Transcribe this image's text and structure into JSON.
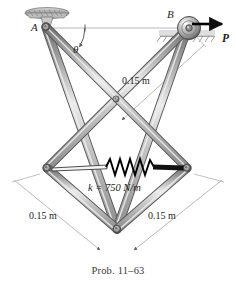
{
  "figure": {
    "type": "engineering-mechanics-diagram",
    "caption": "Prob. 11–63",
    "labels": {
      "point_a": "A",
      "point_b": "B",
      "angle_theta": "θ",
      "force_p": "P",
      "spring_constant": "k = 750 N/m",
      "dim_upper_right": "0.15 m",
      "dim_lower_left": "0.15 m",
      "dim_lower_right": "0.15 m"
    },
    "values": {
      "spring_stiffness_value": "750",
      "spring_stiffness_units": "N/m",
      "member_length_value": "0.15",
      "member_length_units": "m",
      "problem_number": "11–63"
    },
    "colors": {
      "bar_fill": "#b8b8b8",
      "bar_highlight": "#e6e6e6",
      "bar_stroke": "#4d4d4d",
      "pin_fill": "#8c8c8c",
      "text": "#231f20",
      "caption": "#3a3a3a",
      "dimension_line": "#9a9a9a",
      "force_arrow": "#000000",
      "spring": "#000000",
      "support_hatch": "#8a8a8a"
    },
    "geometry": {
      "point_a": [
        46,
        27
      ],
      "point_b": [
        187,
        27
      ],
      "center_pin": [
        116,
        99
      ],
      "left_pin": [
        47,
        168
      ],
      "right_pin": [
        187,
        168
      ],
      "bottom_pin": [
        117,
        229
      ]
    },
    "icons": {
      "pin_support": "pin-support-icon",
      "roller_support": "roller-support-icon",
      "spring": "spring-icon",
      "force_arrow": "force-arrow-icon",
      "angle_arc": "angle-arc-icon"
    }
  }
}
